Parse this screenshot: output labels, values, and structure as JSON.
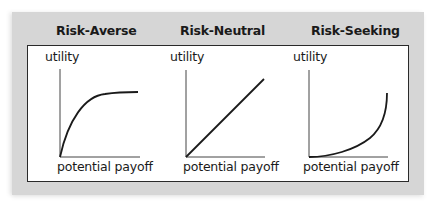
{
  "diagram": {
    "panels": [
      {
        "title": "Risk-Averse",
        "y_label": "utility",
        "x_label": "potential payoff",
        "curve_shape": "concave"
      },
      {
        "title": "Risk-Neutral",
        "y_label": "utility",
        "x_label": "potential payoff",
        "curve_shape": "linear"
      },
      {
        "title": "Risk-Seeking",
        "y_label": "utility",
        "x_label": "potential payoff",
        "curve_shape": "convex"
      }
    ],
    "colors": {
      "panel_background": "#d6d6d6",
      "box_background": "#ffffff",
      "line": "#1a1a1a"
    }
  }
}
